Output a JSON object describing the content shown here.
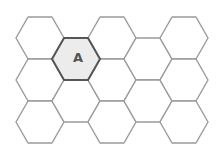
{
  "diagram": {
    "type": "hex-grid",
    "orientation": "flat-top",
    "hex": {
      "radius_x": 24,
      "half_height": 21
    },
    "colors": {
      "background": "#ffffff",
      "stroke": "#9a9a9a",
      "highlight_fill": "#ececec",
      "highlight_stroke": "#555555",
      "label": "#555555"
    },
    "cells": [
      {
        "col": 1,
        "row": 1,
        "cx": 40,
        "cy": 38,
        "label": "",
        "highlight": false
      },
      {
        "col": 1,
        "row": 2,
        "cx": 40,
        "cy": 80,
        "label": "",
        "highlight": false
      },
      {
        "col": 1,
        "row": 3,
        "cx": 40,
        "cy": 122,
        "label": "",
        "highlight": false
      },
      {
        "col": 2,
        "row": 1,
        "cx": 76,
        "cy": 59,
        "label": "A",
        "highlight": true
      },
      {
        "col": 2,
        "row": 2,
        "cx": 76,
        "cy": 101,
        "label": "",
        "highlight": false
      },
      {
        "col": 3,
        "row": 1,
        "cx": 112,
        "cy": 38,
        "label": "",
        "highlight": false
      },
      {
        "col": 3,
        "row": 2,
        "cx": 112,
        "cy": 80,
        "label": "",
        "highlight": false
      },
      {
        "col": 3,
        "row": 3,
        "cx": 112,
        "cy": 122,
        "label": "",
        "highlight": false
      },
      {
        "col": 4,
        "row": 1,
        "cx": 148,
        "cy": 59,
        "label": "",
        "highlight": false
      },
      {
        "col": 4,
        "row": 2,
        "cx": 148,
        "cy": 101,
        "label": "",
        "highlight": false
      },
      {
        "col": 5,
        "row": 1,
        "cx": 184,
        "cy": 38,
        "label": "",
        "highlight": false
      },
      {
        "col": 5,
        "row": 2,
        "cx": 184,
        "cy": 80,
        "label": "",
        "highlight": false
      },
      {
        "col": 5,
        "row": 3,
        "cx": 184,
        "cy": 122,
        "label": "",
        "highlight": false
      }
    ]
  }
}
